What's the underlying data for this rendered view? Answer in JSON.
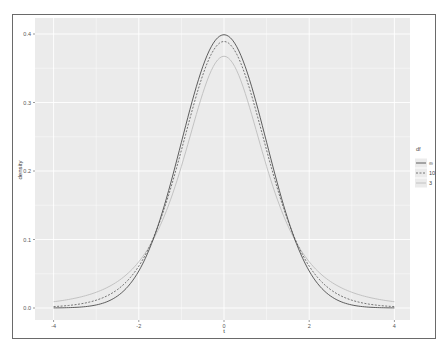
{
  "chart_data": {
    "type": "line",
    "title": "",
    "xlabel": "t",
    "ylabel": "density",
    "xlim": [
      -4,
      4
    ],
    "ylim": [
      0.0,
      0.4
    ],
    "x_ticks": [
      "-4",
      "-2",
      "0",
      "2",
      "4"
    ],
    "y_ticks": [
      "0.0",
      "0.1",
      "0.2",
      "0.3",
      "0.4"
    ],
    "grid": true,
    "legend_position": "right",
    "legend_title": "df",
    "series": [
      {
        "name": "∞",
        "linetype": "solid",
        "color": "#555555",
        "peak": 0.399
      },
      {
        "name": "10",
        "linetype": "dashed",
        "color": "#666666",
        "peak": 0.389
      },
      {
        "name": "3",
        "linetype": "solid-light",
        "color": "#b8b8b8",
        "peak": 0.368
      }
    ],
    "x": [
      -4,
      -3.5,
      -3,
      -2.5,
      -2,
      -1.5,
      -1,
      -0.5,
      0,
      0.5,
      1,
      1.5,
      2,
      2.5,
      3,
      3.5,
      4
    ]
  },
  "legend": {
    "title": "df",
    "items": [
      {
        "label": "∞"
      },
      {
        "label": "10"
      },
      {
        "label": "3"
      }
    ]
  },
  "axes": {
    "x_title": "t",
    "y_title": "density"
  }
}
